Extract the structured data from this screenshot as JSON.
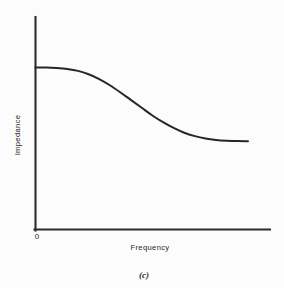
{
  "figure": {
    "caption": "(c)",
    "background_color": "#fcfcfc",
    "line_color": "#262626",
    "axis_color": "#2b2b2b",
    "text_color": "#1f1f1f"
  },
  "chart_data": {
    "type": "line",
    "title": "",
    "xlabel": "Frequency",
    "ylabel": "Impedance",
    "origin_label": "0",
    "grid": false,
    "legend": null,
    "axis_ticks": {
      "x": [
        "0"
      ],
      "y": []
    },
    "xlim": [
      0,
      1
    ],
    "ylim": [
      0,
      1
    ],
    "series": [
      {
        "name": "Impedance vs Frequency",
        "description": "Flat high-impedance plateau at low frequency, sigmoid roll-off through mid-band, flat lower plateau at high frequency",
        "x": [
          0.0,
          0.05,
          0.1,
          0.15,
          0.2,
          0.25,
          0.3,
          0.35,
          0.4,
          0.45,
          0.5,
          0.55,
          0.6,
          0.65,
          0.7,
          0.75,
          0.8,
          0.85,
          0.9,
          0.95,
          1.0
        ],
        "y": [
          1.0,
          1.0,
          0.995,
          0.985,
          0.965,
          0.93,
          0.88,
          0.815,
          0.74,
          0.66,
          0.58,
          0.5,
          0.43,
          0.37,
          0.32,
          0.285,
          0.26,
          0.245,
          0.237,
          0.233,
          0.232
        ]
      }
    ],
    "annotations": [
      {
        "text": "Frequency",
        "role": "x-axis-label"
      },
      {
        "text": "Impedance",
        "role": "y-axis-label"
      },
      {
        "text": "0",
        "role": "origin-tick"
      }
    ]
  }
}
